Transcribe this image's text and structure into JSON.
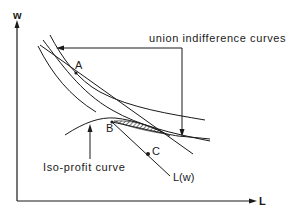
{
  "diagram": {
    "axes": {
      "y_label": "w",
      "x_label": "L"
    },
    "points": [
      {
        "id": "A",
        "label": "A"
      },
      {
        "id": "B",
        "label": "B"
      },
      {
        "id": "C",
        "label": "C"
      }
    ],
    "annotations": {
      "union_indifference": "union indifference curves",
      "iso_profit": "Iso-profit curve",
      "labour_demand": "L(w)"
    },
    "colors": {
      "ink": "#1a1a1a",
      "background": "#ffffff"
    }
  }
}
